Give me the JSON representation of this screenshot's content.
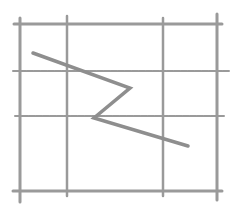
{
  "diagram": {
    "canvas": {
      "width": 237,
      "height": 205,
      "background": "#ffffff"
    },
    "style": {
      "line_color": "#9a9a9a",
      "path_color": "#8e8e8e",
      "sketch": "pencil"
    },
    "grid": {
      "vertical_lines": [
        {
          "x": 20,
          "y1": 18,
          "y2": 202,
          "width": 3
        },
        {
          "x": 67,
          "y1": 16,
          "y2": 196,
          "width": 2.5
        },
        {
          "x": 163,
          "y1": 18,
          "y2": 196,
          "width": 2.5
        },
        {
          "x": 217,
          "y1": 14,
          "y2": 200,
          "width": 3
        }
      ],
      "horizontal_lines": [
        {
          "y": 24,
          "x1": 14,
          "x2": 222,
          "width": 3
        },
        {
          "y": 71,
          "x1": 13,
          "x2": 229,
          "width": 2
        },
        {
          "y": 116,
          "x1": 15,
          "x2": 225,
          "width": 2
        },
        {
          "y": 191,
          "x1": 13,
          "x2": 222,
          "width": 3
        }
      ]
    },
    "zigzag_path": {
      "points": [
        [
          33,
          53
        ],
        [
          130,
          88
        ],
        [
          94,
          118
        ],
        [
          188,
          146
        ]
      ],
      "width": 3.5
    }
  }
}
